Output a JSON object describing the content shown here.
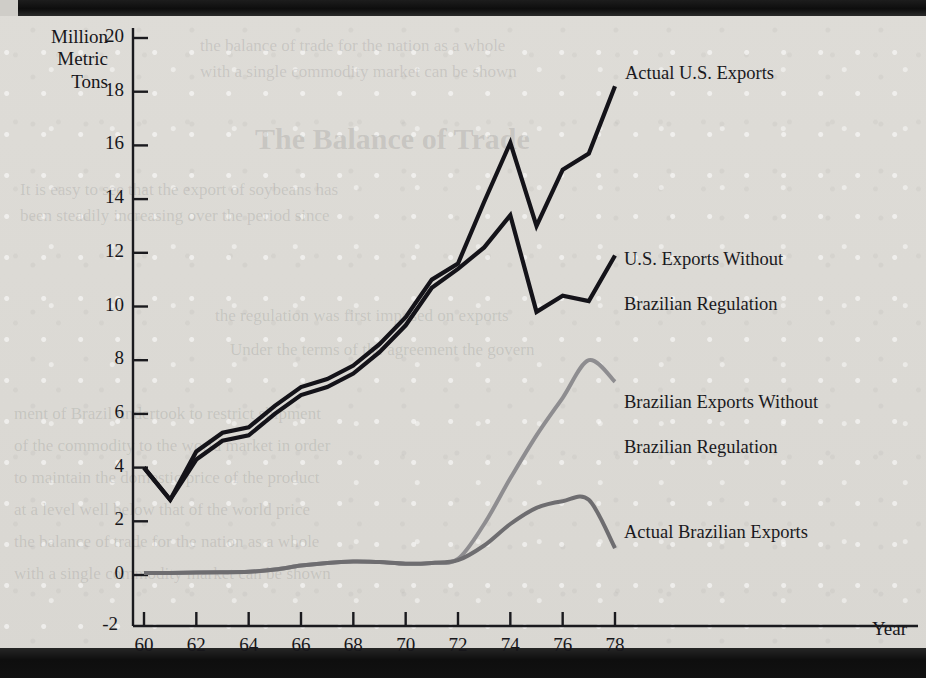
{
  "chart_data": {
    "type": "line",
    "title": "",
    "xlabel": "Year",
    "ylabel": "Million Metric Tons",
    "xlim": [
      60,
      79.5
    ],
    "ylim": [
      -2,
      20
    ],
    "grid": false,
    "legend_position": "inline-right-of-series",
    "x": [
      60,
      61,
      62,
      63,
      64,
      65,
      66,
      67,
      68,
      69,
      70,
      71,
      72,
      73,
      74,
      75,
      76,
      77,
      78
    ],
    "y_ticks": [
      -2,
      0,
      2,
      4,
      6,
      8,
      10,
      12,
      14,
      16,
      18,
      20
    ],
    "y_tick_labels": [
      "-2",
      "0",
      "2",
      "4",
      "6",
      "8",
      "10",
      "12",
      "14",
      "16",
      "18",
      "20"
    ],
    "x_ticks": [
      60,
      62,
      64,
      66,
      68,
      70,
      72,
      74,
      76,
      78
    ],
    "x_tick_labels": [
      "60",
      "62",
      "64",
      "66",
      "68",
      "70",
      "72",
      "74",
      "76",
      "78"
    ],
    "series": [
      {
        "name": "Actual U.S. Exports",
        "color": "#141319",
        "style": "solid",
        "width": 4.2,
        "values": [
          4.0,
          2.8,
          4.6,
          5.3,
          5.5,
          6.3,
          7.0,
          7.3,
          7.8,
          8.6,
          9.6,
          11.0,
          11.6,
          13.9,
          16.1,
          13.0,
          15.1,
          15.7,
          18.2
        ]
      },
      {
        "name": "U.S. Exports Without\nBrazilian Regulation",
        "color": "#141319",
        "style": "solid",
        "width": 4.2,
        "values": [
          4.0,
          2.8,
          4.3,
          5.0,
          5.2,
          6.0,
          6.7,
          7.0,
          7.5,
          8.3,
          9.3,
          10.7,
          11.4,
          12.2,
          13.4,
          9.8,
          10.4,
          10.2,
          11.9
        ]
      },
      {
        "name": "Brazilian Exports Without\nBrazilian Regulation",
        "color": "#8e8d90",
        "style": "solid",
        "width": 4.0,
        "values": [
          0.08,
          0.08,
          0.09,
          0.1,
          0.12,
          0.2,
          0.35,
          0.45,
          0.5,
          0.48,
          0.42,
          0.45,
          0.6,
          1.9,
          3.6,
          5.2,
          6.6,
          8.0,
          7.2
        ]
      },
      {
        "name": "Actual Brazilian Exports",
        "color": "#6e6d70",
        "style": "solid",
        "width": 4.0,
        "values": [
          0.08,
          0.08,
          0.09,
          0.1,
          0.12,
          0.2,
          0.35,
          0.45,
          0.5,
          0.48,
          0.42,
          0.45,
          0.55,
          1.1,
          1.9,
          2.5,
          2.75,
          2.8,
          1.0
        ]
      }
    ]
  },
  "axis": {
    "y_label_line1": "Million",
    "y_label_line2": "Metric",
    "y_label_line3": "Tons",
    "x_label": "Year"
  },
  "labels": {
    "actual_us": "Actual U.S. Exports",
    "us_without_l1": "U.S. Exports Without",
    "us_without_l2": "Brazilian Regulation",
    "br_without_l1": "Brazilian Exports Without",
    "br_without_l2": "Brazilian Regulation",
    "actual_br": "Actual Brazilian Exports"
  },
  "ghost_text": {
    "g1": "the balance of trade for the nation as a whole",
    "g2": "with a single commodity market can be shown",
    "g3": "The Balance of Trade",
    "g4": "It is easy to see that the export of soybeans has",
    "g5": "been steadily increasing over the period since",
    "g6": "the regulation was first imposed on exports",
    "g7": "Under the terms of the agreement the govern",
    "g8": "ment of Brazil undertook to restrict shipment",
    "g9": "of the commodity to the world market in order",
    "g10": "to maintain the domestic price of the product",
    "g11": "at a level well below that of the world price"
  }
}
